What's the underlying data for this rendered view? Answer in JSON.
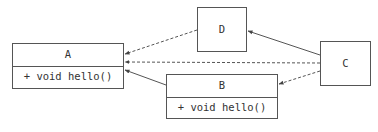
{
  "diagram": {
    "type": "uml-class-diagram",
    "nodes": [
      {
        "id": "A",
        "name": "A",
        "methods": [
          "+ void hello()"
        ]
      },
      {
        "id": "B",
        "name": "B",
        "methods": [
          "+ void hello()"
        ]
      },
      {
        "id": "C",
        "name": "C"
      },
      {
        "id": "D",
        "name": "D"
      }
    ],
    "edges": [
      {
        "from": "D",
        "to": "A",
        "style": "dashed"
      },
      {
        "from": "C",
        "to": "A",
        "style": "dashed"
      },
      {
        "from": "B",
        "to": "A",
        "style": "solid"
      },
      {
        "from": "C",
        "to": "D",
        "style": "solid"
      },
      {
        "from": "C",
        "to": "B",
        "style": "dashed"
      }
    ],
    "colors": {
      "line": "#555555",
      "text": "#333333",
      "background": "#ffffff"
    }
  }
}
